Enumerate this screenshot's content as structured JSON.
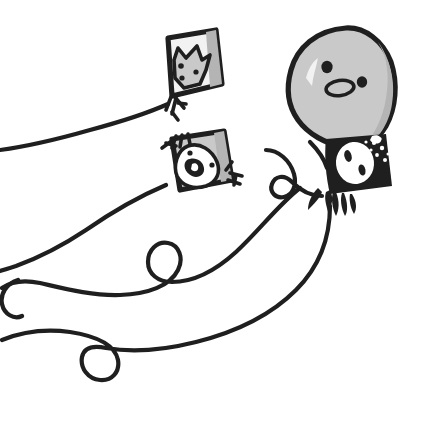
{
  "artwork": {
    "title": "Three kites with animal faces and a large bird character",
    "medium": "hand-drawn ink and gray marker illustration",
    "background_color": "#ffffff",
    "ink_color": "#1f1f1f",
    "gray_fill": "#c9c9c9",
    "gray_shadow": "#b4b4b4",
    "light_fill": "#f2f2f2",
    "canvas": {
      "width": 423,
      "height": 426
    }
  },
  "objects": [
    {
      "id": "kite-cat",
      "label": "Top-left kite with cat face",
      "position": "top-left",
      "body_color": "#f2f2f2",
      "figure_color": "#c9c9c9",
      "features": "pointy-eared cat head with two eyes and a nose dot",
      "tassel": "bottom-left bundle of strokes"
    },
    {
      "id": "kite-dog",
      "label": "Middle kite with dog face",
      "position": "center-left",
      "body_color": "#c9c9c9",
      "figure_color": "#ffffff",
      "features": "white rounded dog head, two eye dots and a large blot nose",
      "tassel": "tassels at upper-left and lower-right corners"
    },
    {
      "id": "kite-black",
      "label": "Right black kite with white mask face",
      "position": "center-right",
      "body_color": "#1f1f1f",
      "figure_color": "#ffffff",
      "features": "white oval face with two almond eyes and nose, scattered white dots",
      "tassel": "black fringe along the bottom edge"
    },
    {
      "id": "bird-character",
      "label": "Large gray bird balloon character",
      "position": "top-right",
      "body_color": "#c9c9c9",
      "features": "tall rounded teardrop body, two round eyes, oval beak, white highlight"
    }
  ],
  "strings": {
    "count": 4,
    "description": "Long looping kite strings trailing to the lower-left, with curl loops",
    "loops": [
      "left-edge curl",
      "center curl",
      "lower-left curl",
      "right curl near black kite"
    ]
  }
}
